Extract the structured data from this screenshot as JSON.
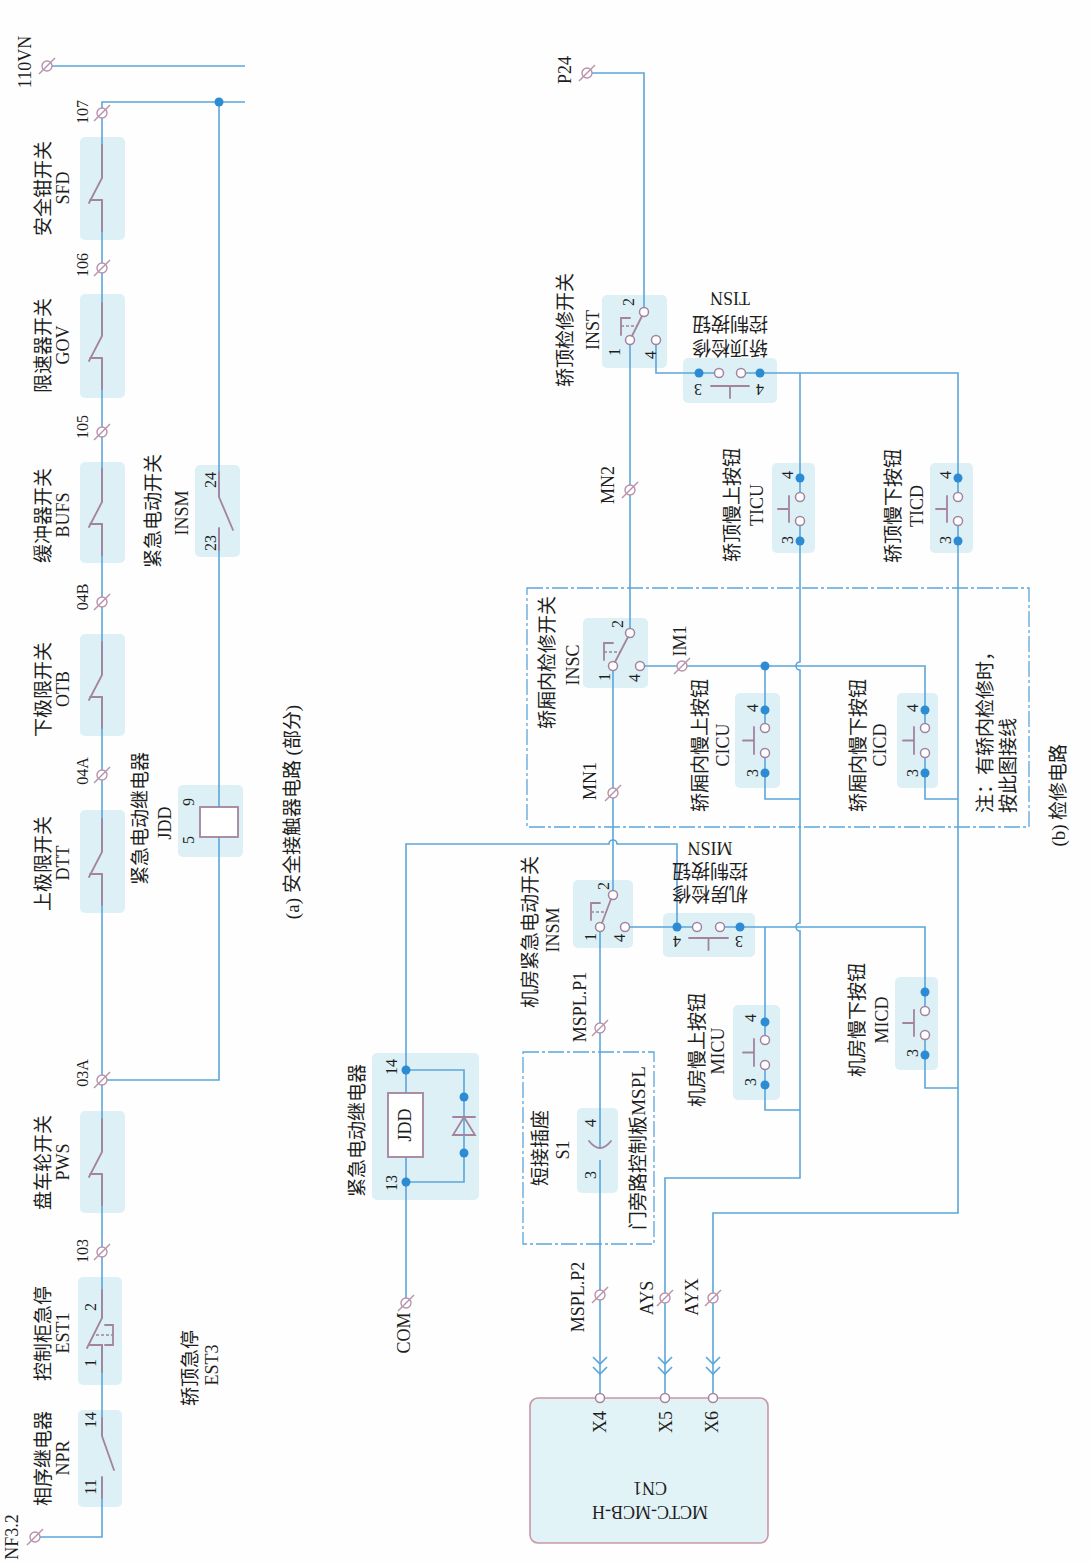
{
  "colors": {
    "wire": "#5ba6da",
    "junction": "#2d8bd3",
    "component_bg": "#dcf0f6",
    "symbol": "#a3839d",
    "terminal": "#b892ab",
    "controller_bg": "#e2f3f7",
    "controller_border": "#c996a6",
    "text": "#1e1e1e"
  },
  "part_a": {
    "caption": "(a) 安全接触器电路 (部分)",
    "terminals": {
      "n110vn": "110VN",
      "n107": "107",
      "n106": "106",
      "n105": "105",
      "n04b": "04B",
      "n04a": "04A",
      "n03a": "03A",
      "n103": "103",
      "nf32": "NF3.2"
    },
    "components": {
      "sfd": {
        "name": "安全钳开关",
        "code": "SFD"
      },
      "gov": {
        "name": "限速器开关",
        "code": "GOV"
      },
      "bufs": {
        "name": "缓冲器开关",
        "code": "BUFS"
      },
      "otb": {
        "name": "下极限开关",
        "code": "OTB"
      },
      "dtt": {
        "name": "上极限开关",
        "code": "DTT"
      },
      "pws": {
        "name": "盘车轮开关",
        "code": "PWS"
      },
      "est1": {
        "name": "控制柜急停",
        "code": "EST1",
        "pins": {
          "p1": "1",
          "p2": "2"
        }
      },
      "npr": {
        "name": "相序继电器",
        "code": "NPR",
        "pins": {
          "p11": "11",
          "p14": "14"
        }
      },
      "est3": {
        "name": "轿顶急停",
        "code": "EST3"
      },
      "insm": {
        "name": "紧急电动开关",
        "code": "INSM",
        "pins": {
          "p23": "23",
          "p24": "24"
        }
      },
      "jdd": {
        "name": "紧急电动继电器",
        "code": "JDD",
        "pins": {
          "p5": "5",
          "p9": "9"
        }
      }
    }
  },
  "part_b": {
    "caption": "(b) 检修电路",
    "terminals": {
      "p24": "P24",
      "mn2": "MN2",
      "im1": "IM1",
      "mn1": "MN1",
      "mspl_p1": "MSPL.P1",
      "mspl_p2": "MSPL.P2",
      "com": "COM",
      "ays": "AYS",
      "ayx": "AYX"
    },
    "components": {
      "inst": {
        "name": "轿顶检修开关",
        "code": "INST",
        "pins": {
          "p1": "1",
          "p2": "2",
          "p4": "4"
        }
      },
      "tisn": {
        "name_line1": "轿顶检修",
        "name_line2": "控制按钮",
        "code": "TISN",
        "pins": {
          "p3": "3",
          "p4": "4"
        }
      },
      "ticu": {
        "name": "轿顶慢上按钮",
        "code": "TICU",
        "pins": {
          "p3": "3",
          "p4": "4"
        }
      },
      "ticd": {
        "name": "轿顶慢下按钮",
        "code": "TICD",
        "pins": {
          "p3": "3",
          "p4": "4"
        }
      },
      "insc": {
        "name": "轿厢内检修开关",
        "code": "INSC",
        "pins": {
          "p1": "1",
          "p2": "2",
          "p4": "4"
        }
      },
      "cicu": {
        "name": "轿厢内慢上按钮",
        "code": "CICU",
        "pins": {
          "p3": "3",
          "p4": "4"
        }
      },
      "cicd": {
        "name": "轿厢内慢下按钮",
        "code": "CICD",
        "pins": {
          "p3": "3",
          "p4": "4"
        }
      },
      "insm": {
        "name": "机房紧急电动开关",
        "code": "INSM",
        "pins": {
          "p1": "1",
          "p2": "2",
          "p4": "4"
        }
      },
      "misn": {
        "name_line1": "机房检修",
        "name_line2": "控制按钮",
        "code": "MISN",
        "pins": {
          "p3": "3",
          "p4": "4"
        }
      },
      "micu": {
        "name": "机房慢上按钮",
        "code": "MICU",
        "pins": {
          "p3": "3",
          "p4": "4"
        }
      },
      "micd": {
        "name": "机房慢下按钮",
        "code": "MICD",
        "pins": {
          "p3": "3"
        }
      },
      "jdd": {
        "name": "紧急电动继电器",
        "code": "JDD",
        "pins": {
          "p13": "13",
          "p14": "14"
        }
      },
      "s1": {
        "name": "短接插座",
        "code": "S1",
        "pins": {
          "p3": "3",
          "p4": "4"
        }
      },
      "mspl": {
        "name": "门旁路控制板MSPL"
      }
    },
    "inspection_note": {
      "line1": "注：有轿内检修时，",
      "line2": "按此图接线"
    },
    "controller": {
      "model": "MCTC-MCB-H",
      "connector": "CN1",
      "pins": {
        "x4": "X4",
        "x5": "X5",
        "x6": "X6"
      }
    }
  }
}
